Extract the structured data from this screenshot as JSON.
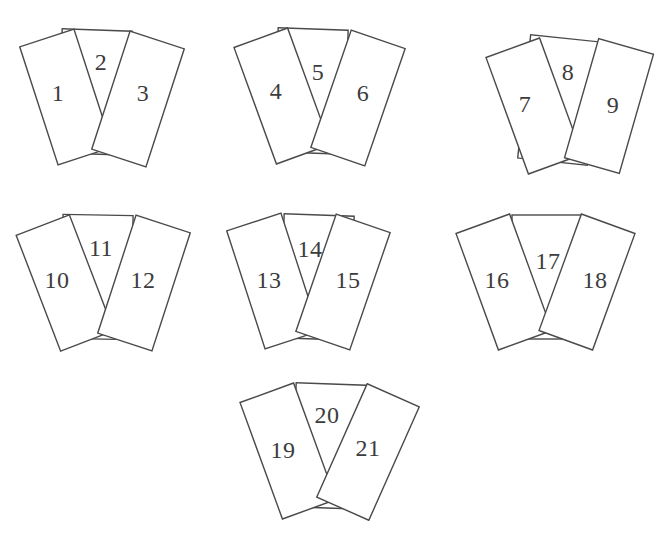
{
  "figure": {
    "canvas": {
      "width": 664,
      "height": 535,
      "background": "#ffffff"
    },
    "card_style": {
      "fill": "#ffffff",
      "stroke": "#4a4a4a",
      "stroke_width": 1.4,
      "side_card": {
        "width": 57,
        "height": 124
      },
      "middle_card": {
        "width": 70,
        "height": 124
      }
    },
    "label_style": {
      "color": "#3c3c3c",
      "font_size": 24
    },
    "groups": [
      {
        "name": "card-group-1-2-3",
        "regions": [
          {
            "role": "middle",
            "label": "2",
            "cx": 95,
            "cy": 92,
            "rotation": 2,
            "label_x": 101,
            "label_y": 62
          },
          {
            "role": "left",
            "label": "1",
            "cx": 66,
            "cy": 97,
            "rotation": -18,
            "label_x": 58,
            "label_y": 93
          },
          {
            "role": "right",
            "label": "3",
            "cx": 138,
            "cy": 99,
            "rotation": 18,
            "label_x": 143,
            "label_y": 93
          }
        ]
      },
      {
        "name": "card-group-4-5-6",
        "regions": [
          {
            "role": "middle",
            "label": "5",
            "cx": 311,
            "cy": 91,
            "rotation": 2,
            "label_x": 318,
            "label_y": 72
          },
          {
            "role": "left",
            "label": "4",
            "cx": 282,
            "cy": 96,
            "rotation": -20,
            "label_x": 276,
            "label_y": 91
          },
          {
            "role": "right",
            "label": "6",
            "cx": 358,
            "cy": 98,
            "rotation": 19,
            "label_x": 363,
            "label_y": 93
          }
        ]
      },
      {
        "name": "card-group-7-8-9",
        "regions": [
          {
            "role": "middle",
            "label": "8",
            "cx": 559,
            "cy": 100,
            "rotation": 6,
            "label_x": 568,
            "label_y": 72
          },
          {
            "role": "left",
            "label": "7",
            "cx": 534,
            "cy": 106,
            "rotation": -20,
            "label_x": 525,
            "label_y": 104
          },
          {
            "role": "right",
            "label": "9",
            "cx": 609,
            "cy": 106,
            "rotation": 16,
            "label_x": 613,
            "label_y": 105
          }
        ]
      },
      {
        "name": "card-group-10-11-12",
        "regions": [
          {
            "role": "middle",
            "label": "11",
            "cx": 97,
            "cy": 277,
            "rotation": 1,
            "label_x": 101,
            "label_y": 248
          },
          {
            "role": "left",
            "label": "10",
            "cx": 65,
            "cy": 283,
            "rotation": -21,
            "label_x": 57,
            "label_y": 280
          },
          {
            "role": "right",
            "label": "12",
            "cx": 144,
            "cy": 283,
            "rotation": 18,
            "label_x": 143,
            "label_y": 280
          }
        ]
      },
      {
        "name": "card-group-13-14-15",
        "regions": [
          {
            "role": "middle",
            "label": "14",
            "cx": 317,
            "cy": 277,
            "rotation": 2,
            "label_x": 310,
            "label_y": 249
          },
          {
            "role": "left",
            "label": "13",
            "cx": 273,
            "cy": 281,
            "rotation": -18,
            "label_x": 269,
            "label_y": 280
          },
          {
            "role": "right",
            "label": "15",
            "cx": 343,
            "cy": 282,
            "rotation": 19,
            "label_x": 348,
            "label_y": 280
          }
        ]
      },
      {
        "name": "card-group-16-17-18",
        "regions": [
          {
            "role": "middle",
            "label": "17",
            "cx": 547,
            "cy": 277,
            "rotation": 0,
            "label_x": 548,
            "label_y": 261
          },
          {
            "role": "left",
            "label": "16",
            "cx": 504,
            "cy": 282,
            "rotation": -20,
            "label_x": 497,
            "label_y": 280
          },
          {
            "role": "right",
            "label": "18",
            "cx": 587,
            "cy": 282,
            "rotation": 20,
            "label_x": 595,
            "label_y": 280
          }
        ]
      },
      {
        "name": "card-group-19-20-21",
        "regions": [
          {
            "role": "middle",
            "label": "20",
            "cx": 329,
            "cy": 446,
            "rotation": 2,
            "label_x": 327,
            "label_y": 415
          },
          {
            "role": "left",
            "label": "19",
            "cx": 288,
            "cy": 451,
            "rotation": -20,
            "label_x": 283,
            "label_y": 450
          },
          {
            "role": "right",
            "label": "21",
            "cx": 368,
            "cy": 452,
            "rotation": 24,
            "label_x": 368,
            "label_y": 448
          }
        ]
      }
    ]
  }
}
